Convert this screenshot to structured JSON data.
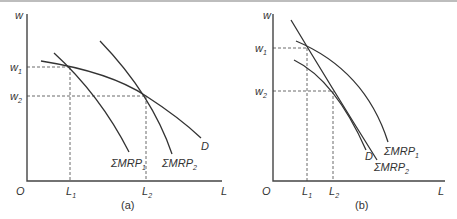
{
  "figure": {
    "panels": [
      {
        "id": "a",
        "caption": "(a)",
        "y_axis_label": "w",
        "x_axis_label": "L",
        "origin_label": "O",
        "y_ticks": [
          {
            "label": "w",
            "sub": "1"
          },
          {
            "label": "w",
            "sub": "2"
          }
        ],
        "x_ticks": [
          {
            "label": "L",
            "sub": "1"
          },
          {
            "label": "L",
            "sub": "2"
          }
        ],
        "curves": [
          {
            "name": "D",
            "label": "D",
            "sub": ""
          },
          {
            "name": "sum-mrp-1",
            "label": "ΣMRP",
            "sub": "1"
          },
          {
            "name": "sum-mrp-2",
            "label": "ΣMRP",
            "sub": "2"
          }
        ]
      },
      {
        "id": "b",
        "caption": "(b)",
        "y_axis_label": "w",
        "x_axis_label": "L",
        "origin_label": "O",
        "y_ticks": [
          {
            "label": "w",
            "sub": "1"
          },
          {
            "label": "w",
            "sub": "2"
          }
        ],
        "x_ticks": [
          {
            "label": "L",
            "sub": "1"
          },
          {
            "label": "L",
            "sub": "2"
          }
        ],
        "curves": [
          {
            "name": "D",
            "label": "D",
            "sub": ""
          },
          {
            "name": "sum-mrp-1",
            "label": "ΣMRP",
            "sub": "1"
          },
          {
            "name": "sum-mrp-2",
            "label": "ΣMRP",
            "sub": "2"
          }
        ]
      }
    ]
  },
  "colors": {
    "ink": "#333333",
    "border": "#bdbdbd",
    "background": "#ffffff"
  }
}
